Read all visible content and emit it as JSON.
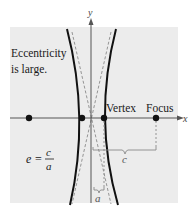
{
  "figure": {
    "annotation": "Eccentricity\nis large.",
    "annotation_lines": [
      "Eccentricity",
      "is large."
    ],
    "formula": {
      "lhs": "e",
      "equals": "=",
      "numerator": "c",
      "denominator": "a"
    },
    "labels": {
      "vertex": "Vertex",
      "focus": "Focus",
      "x_axis": "x",
      "y_axis": "y",
      "c_distance": "c",
      "a_distance": "a"
    },
    "colors": {
      "background_panel": "#ececec",
      "curve": "#111111",
      "axis": "#555555",
      "dashed": "#8a8a8a",
      "text": "#1a1a1a"
    }
  }
}
